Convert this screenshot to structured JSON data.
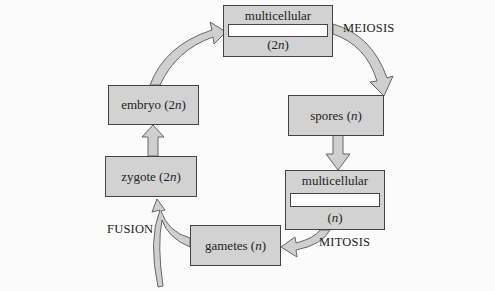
{
  "diagram": {
    "type": "life-cycle",
    "nodes": {
      "sporophyte": {
        "label": "multicellular",
        "ploidy_prefix": "(2",
        "ploidy_var": "n",
        "ploidy_suffix": ")"
      },
      "spores": {
        "label_prefix": "spores (",
        "var": "n",
        "label_suffix": ")"
      },
      "gametophyte": {
        "label": "multicellular",
        "ploidy_prefix": "(",
        "ploidy_var": "n",
        "ploidy_suffix": ")"
      },
      "gametes": {
        "label_prefix": "gametes (",
        "var": "n",
        "label_suffix": ")"
      },
      "zygote": {
        "label_prefix": "zygote (2",
        "var": "n",
        "label_suffix": ")"
      },
      "embryo": {
        "label_prefix": "embryo (2",
        "var": "n",
        "label_suffix": ")"
      }
    },
    "processes": {
      "meiosis": "MEIOSIS",
      "mitosis": "MITOSIS",
      "fusion": "FUSION"
    },
    "colors": {
      "box_fill": "#d2d2d2",
      "arrow_fill": "#cfcfcf",
      "outline": "#444444",
      "background": "#fbfbfb"
    }
  }
}
